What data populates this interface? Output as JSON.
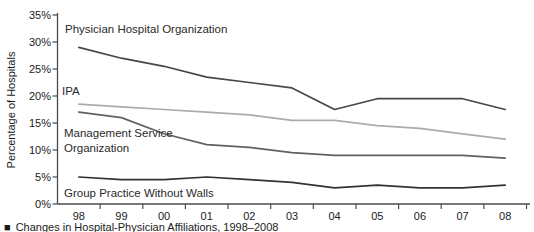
{
  "chart_data": {
    "type": "line",
    "title": "",
    "xlabel": "",
    "ylabel": "Percentage of Hospitals",
    "x_labels": [
      "98",
      "99",
      "00",
      "01",
      "02",
      "03",
      "04",
      "05",
      "06",
      "07",
      "08"
    ],
    "y_ticks": [
      "35%",
      "30%",
      "25%",
      "20%",
      "15%",
      "10%",
      "5%",
      "0%"
    ],
    "ylim": [
      0,
      35
    ],
    "grid": false,
    "legend_position": "inline-labels-on-chart",
    "series": [
      {
        "name": "Physician Hospital Organization",
        "color": "#474747",
        "values": [
          29,
          27,
          25.5,
          23.5,
          22.5,
          21.5,
          17.5,
          19.5,
          19.5,
          19.5,
          17.5
        ]
      },
      {
        "name": "IPA",
        "color": "#ababab",
        "values": [
          18.5,
          18,
          17.5,
          17,
          16.5,
          15.5,
          15.5,
          14.5,
          14,
          13,
          12
        ]
      },
      {
        "name": "Management Service Organization",
        "color": "#616161",
        "values": [
          17,
          16,
          13,
          11,
          10.5,
          9.5,
          9,
          9,
          9,
          9,
          8.5
        ]
      },
      {
        "name": "Group Practice Without Walls",
        "color": "#333333",
        "values": [
          5,
          4.5,
          4.5,
          5,
          4.5,
          4,
          3,
          3.5,
          3,
          3,
          3.5
        ]
      }
    ]
  },
  "labels": {
    "pho": "Physician Hospital Organization",
    "ipa": "IPA",
    "mso_line1": "Management Service",
    "mso_line2": "Organization",
    "gpww": "Group Practice Without Walls"
  },
  "caption": {
    "marker": "■",
    "text": "Changes in Hospital-Physician Affiliations, 1998–2008"
  },
  "colors": {
    "axis": "#4a4a4a",
    "text": "#1a1a1a",
    "background": "#ffffff"
  }
}
